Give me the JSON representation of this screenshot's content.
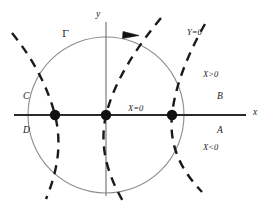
{
  "figure": {
    "type": "phase-portrait-diagram",
    "background_color": "#ffffff",
    "ink_color": "#1a1a1a",
    "curve_color": "#8c8c8c"
  },
  "axes": {
    "x_label": "x",
    "y_label": "y",
    "origin": {
      "x": 106,
      "y": 115
    },
    "x_axis_start": 14,
    "x_axis_end": 246,
    "y_axis_top": 22,
    "y_axis_bottom": 196
  },
  "circle": {
    "name": "Γ",
    "label": "Γ",
    "center_x": 106,
    "center_y": 115,
    "radius": 78,
    "orientation": "clockwise",
    "arrow_label": "direction-arrow"
  },
  "equilibria": [
    {
      "name": "left-point",
      "x": 55,
      "y": 115
    },
    {
      "name": "origin-point",
      "x": 106,
      "y": 115
    },
    {
      "name": "right-point",
      "x": 172,
      "y": 115
    }
  ],
  "nullclines": [
    {
      "name": "left-nullcline",
      "style": "dashed"
    },
    {
      "name": "center-nullcline",
      "style": "dashed"
    },
    {
      "name": "right-nullcline",
      "style": "dashed"
    }
  ],
  "labels": {
    "x_equals_zero": "X=0",
    "y_equals_zero": "Y=0",
    "x_greater_zero": "X>0",
    "x_less_zero": "X<0",
    "region_a": "A",
    "region_b": "B",
    "region_c": "C",
    "region_d": "D"
  }
}
